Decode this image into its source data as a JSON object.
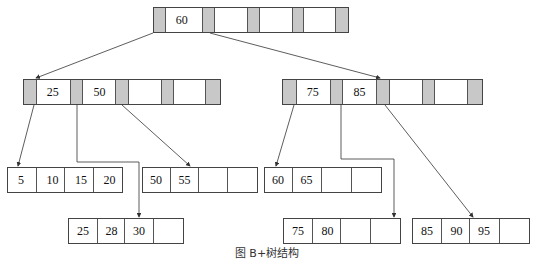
{
  "diagram": {
    "type": "B+ tree",
    "root": {
      "keys": [
        "60",
        "",
        "",
        ""
      ]
    },
    "internal": [
      {
        "id": "left",
        "keys": [
          "25",
          "50",
          "",
          ""
        ]
      },
      {
        "id": "right",
        "keys": [
          "75",
          "85",
          "",
          ""
        ]
      }
    ],
    "leaves": [
      {
        "id": "leaf1",
        "keys": [
          "5",
          "10",
          "15",
          "20"
        ]
      },
      {
        "id": "leaf2",
        "keys": [
          "25",
          "28",
          "30",
          ""
        ]
      },
      {
        "id": "leaf3",
        "keys": [
          "50",
          "55",
          "",
          ""
        ]
      },
      {
        "id": "leaf4",
        "keys": [
          "60",
          "65",
          "",
          ""
        ]
      },
      {
        "id": "leaf5",
        "keys": [
          "75",
          "80",
          "",
          ""
        ]
      },
      {
        "id": "leaf6",
        "keys": [
          "85",
          "90",
          "95",
          ""
        ]
      }
    ],
    "caption": "图 B+树结构",
    "colors": {
      "pointer_cell": "#c8c8c8",
      "border": "#444444",
      "line": "#333333"
    }
  }
}
